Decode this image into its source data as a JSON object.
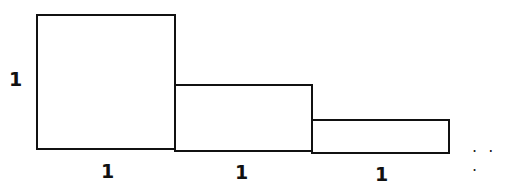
{
  "diagram": {
    "rectangles": [
      {
        "width": 1,
        "height": 1,
        "x": 37,
        "y": 15,
        "w": 138,
        "h": 134
      },
      {
        "width": 1,
        "height": 0.5,
        "x": 175,
        "y": 85,
        "w": 137,
        "h": 66
      },
      {
        "width": 1,
        "height": 0.25,
        "x": 312,
        "y": 120,
        "w": 137,
        "h": 33
      }
    ],
    "height_label": "1",
    "width_labels": [
      "1",
      "1",
      "1"
    ],
    "continuation": "· · ·",
    "stroke_color": "#111111"
  }
}
